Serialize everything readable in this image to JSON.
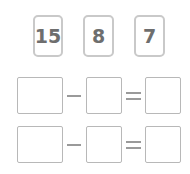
{
  "number_cards": [
    {
      "value": "15"
    },
    {
      "value": "8"
    },
    {
      "value": "7"
    }
  ],
  "equations": [
    {
      "operator": "minus",
      "result_operator": "equals",
      "blanks": [
        "",
        "",
        ""
      ]
    },
    {
      "operator": "minus",
      "result_operator": "equals",
      "blanks": [
        "",
        "",
        ""
      ]
    }
  ],
  "colors": {
    "card_border": "#c9c9c9",
    "card_text": "#6e6e6e",
    "box_border": "#b8b8b8",
    "operator": "#9a9a9a"
  }
}
